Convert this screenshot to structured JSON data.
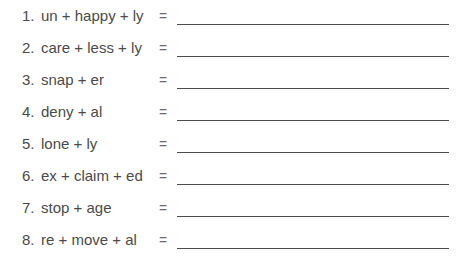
{
  "worksheet": {
    "equals_sign": "=",
    "items": [
      {
        "number": "1.",
        "expression": "un + happy + ly",
        "answer": ""
      },
      {
        "number": "2.",
        "expression": "care + less + ly",
        "answer": ""
      },
      {
        "number": "3.",
        "expression": "snap + er",
        "answer": ""
      },
      {
        "number": "4.",
        "expression": "deny + al",
        "answer": ""
      },
      {
        "number": "5.",
        "expression": "lone + ly",
        "answer": ""
      },
      {
        "number": "6.",
        "expression": "ex + claim + ed",
        "answer": ""
      },
      {
        "number": "7.",
        "expression": "stop + age",
        "answer": ""
      },
      {
        "number": "8.",
        "expression": "re + move + al",
        "answer": ""
      }
    ]
  }
}
